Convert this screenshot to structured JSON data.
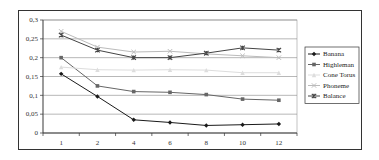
{
  "chart_data": {
    "type": "line",
    "title": "",
    "xlabel": "",
    "ylabel": "",
    "categories": [
      "1",
      "2",
      "4",
      "6",
      "8",
      "10",
      "12"
    ],
    "yticks": [
      "0",
      "0,05",
      "0,1",
      "0,15",
      "0,2",
      "0,25",
      "0,3"
    ],
    "ylim": [
      0,
      0.3
    ],
    "grid": true,
    "legend_position": "right",
    "series": [
      {
        "name": "Banana",
        "color": "#1a1a1a",
        "marker": "diamond",
        "values": [
          0.157,
          0.097,
          0.035,
          0.028,
          0.02,
          0.022,
          0.024
        ]
      },
      {
        "name": "Highleman",
        "color": "#666666",
        "marker": "square",
        "values": [
          0.2,
          0.125,
          0.11,
          0.108,
          0.102,
          0.09,
          0.087
        ]
      },
      {
        "name": "Cone Torus",
        "color": "#dddddd",
        "marker": "triangle",
        "values": [
          0.175,
          0.168,
          0.167,
          0.168,
          0.167,
          0.16,
          0.16
        ]
      },
      {
        "name": "Phoneme",
        "color": "#bbbbbb",
        "marker": "x",
        "values": [
          0.27,
          0.228,
          0.215,
          0.217,
          0.21,
          0.205,
          0.2
        ]
      },
      {
        "name": "Balance",
        "color": "#444444",
        "marker": "star",
        "values": [
          0.26,
          0.22,
          0.2,
          0.2,
          0.212,
          0.226,
          0.22
        ]
      }
    ]
  }
}
